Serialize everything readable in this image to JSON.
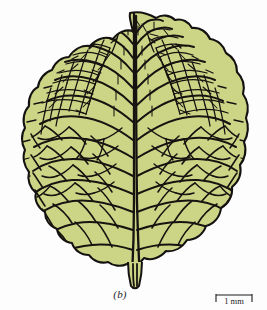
{
  "figure": {
    "caption": "(b)",
    "colors": {
      "lamina_fill": "#ccd486",
      "lamina_fill_shade": "#c3cd7c",
      "vein_stroke": "#161310",
      "outline_stroke": "#141210",
      "background": "#fdfdfd",
      "text": "#1c1c1c"
    }
  },
  "scale_bar": {
    "label": "1 mm",
    "value": 1,
    "unit": "mm",
    "bar_length_px": 36,
    "tick_style": "end-serifs"
  },
  "leaf": {
    "outline_label": "leaf-margin",
    "midrib_label": "midrib",
    "petiole_label": "petiole",
    "secondary_veins_label": "secondary-veins",
    "areoles_label": "areole-network",
    "bounds": {
      "left": 12,
      "top": 12,
      "right": 248,
      "bottom": 287
    }
  }
}
